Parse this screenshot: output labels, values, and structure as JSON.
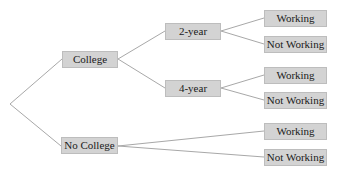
{
  "diagram": {
    "type": "tree",
    "root": "",
    "level1": [
      {
        "label": "College"
      },
      {
        "label": "No College"
      }
    ],
    "level2": [
      {
        "label": "2-year",
        "parent": "College"
      },
      {
        "label": "4-year",
        "parent": "College"
      }
    ],
    "leaves": [
      {
        "label": "Working",
        "parent": "2-year"
      },
      {
        "label": "Not Working",
        "parent": "2-year"
      },
      {
        "label": "Working",
        "parent": "4-year"
      },
      {
        "label": "Not Working",
        "parent": "4-year"
      },
      {
        "label": "Working",
        "parent": "No College"
      },
      {
        "label": "Not Working",
        "parent": "No College"
      }
    ]
  },
  "colors": {
    "node_fill": "#d3d3d3",
    "edge": "#a8a8a8",
    "text": "#1a1a1a"
  }
}
